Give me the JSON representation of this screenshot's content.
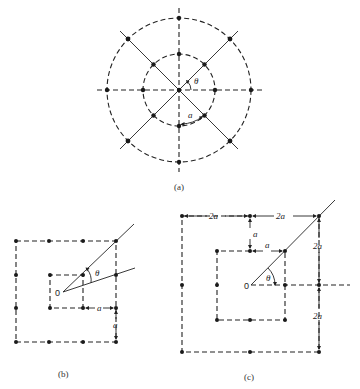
{
  "figure": {
    "panels": [
      {
        "id": "a",
        "caption": "(a)",
        "description": "Polar grid: two concentric dashed circles with 8 radial dashed lines; grid points at intersections",
        "labels": {
          "angle": "θ",
          "arc_length": "a"
        }
      },
      {
        "id": "b",
        "caption": "(b)",
        "description": "Square grid: two concentric dashed squares centered near origin O, spacing a",
        "labels": {
          "origin": "0",
          "angle": "θ",
          "horizontal_spacing": "a",
          "vertical_spacing": "a"
        }
      },
      {
        "id": "c",
        "caption": "(c)",
        "description": "Square grid with origin O at center, inner square half-width a, outer square spacing 2a",
        "labels": {
          "origin": "0",
          "angle": "θ",
          "top_left_span": "2a",
          "top_right_span": "2a",
          "inner_gap_vertical": "a",
          "inner_half_width": "a",
          "right_upper_span": "2a",
          "right_lower_span": "2a"
        }
      }
    ]
  }
}
